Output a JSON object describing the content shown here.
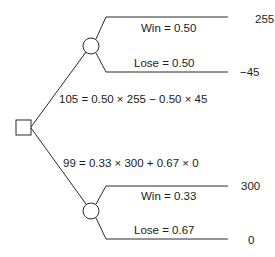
{
  "decision_tree": {
    "decision_node": {
      "shape": "square"
    },
    "options": [
      {
        "expected_value_label": "105 = 0.50 × 255 − 0.50 × 45",
        "chance_node": {
          "shape": "circle"
        },
        "outcomes": [
          {
            "probability_label": "Win = 0.50",
            "payoff": "255"
          },
          {
            "probability_label": "Lose = 0.50",
            "payoff": "−45"
          }
        ]
      },
      {
        "expected_value_label": "99 = 0.33 × 300 + 0.67 × 0",
        "chance_node": {
          "shape": "circle"
        },
        "outcomes": [
          {
            "probability_label": "Win = 0.33",
            "payoff": "300"
          },
          {
            "probability_label": "Lose = 0.67",
            "payoff": "0"
          }
        ]
      }
    ],
    "colors": {
      "line": "#2a2a2a",
      "text": "#1a1a1a",
      "background": "#ffffff"
    }
  }
}
